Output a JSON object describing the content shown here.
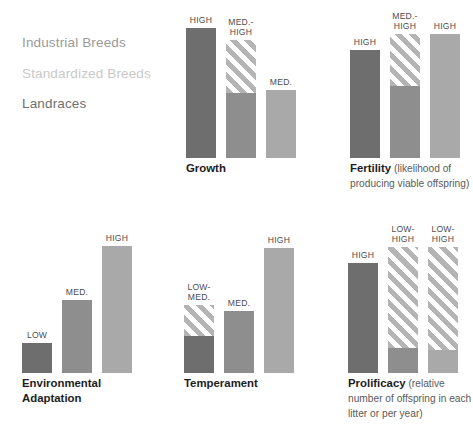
{
  "legend": {
    "items": [
      {
        "label": "Industrial Breeds",
        "color": "#9a9a9a"
      },
      {
        "label": "Standardized Breeds",
        "color": "#c9c9c9"
      },
      {
        "label": "Landraces",
        "color": "#6f6f6f"
      }
    ]
  },
  "colors": {
    "industrial": "#6e6e6e",
    "standardized": "#a9a9a9",
    "landraces": "#8e8e8e",
    "stripe": "#b4b4b4",
    "stripe_gap": "#ffffff",
    "text": "#4d4d4d",
    "caption": "#1d1d1d",
    "caption_sub": "#5a5a5a"
  },
  "chart_data": {
    "type": "bar",
    "title": "",
    "xlabel": "",
    "ylabel": "",
    "grid": false,
    "legend_position": "top-left",
    "scale": [
      "LOW",
      "LOW-MED.",
      "MED.",
      "MED.-HIGH",
      "HIGH"
    ],
    "series": [
      {
        "name": "Industrial Breeds",
        "color": "#6e6e6e"
      },
      {
        "name": "Standardized Breeds",
        "color": "#a9a9a9"
      },
      {
        "name": "Landraces",
        "color": "#8e8e8e"
      }
    ],
    "panels": [
      {
        "id": "growth",
        "title": "Growth",
        "subtitle": "",
        "bars": [
          {
            "series": "Industrial Breeds",
            "label": "HIGH",
            "value": 5,
            "height": 130,
            "striped_fraction": 0
          },
          {
            "series": "Landraces",
            "label": "MED.-\nHIGH",
            "value": 4,
            "height": 118,
            "striped_fraction": 0.45
          },
          {
            "series": "Standardized Breeds",
            "label": "MED.",
            "value": 3,
            "height": 68,
            "striped_fraction": 0
          }
        ]
      },
      {
        "id": "fertility",
        "title": "Fertility",
        "subtitle": "(likelihood of producing viable offspring)",
        "bars": [
          {
            "series": "Industrial Breeds",
            "label": "HIGH",
            "value": 5,
            "height": 108,
            "striped_fraction": 0
          },
          {
            "series": "Landraces",
            "label": "MED.-\nHIGH",
            "value": 4,
            "height": 124,
            "striped_fraction": 0.42
          },
          {
            "series": "Standardized Breeds",
            "label": "HIGH",
            "value": 5,
            "height": 124,
            "striped_fraction": 0
          }
        ]
      },
      {
        "id": "environmental-adaptation",
        "title": "Environmental Adaptation",
        "subtitle": "",
        "bars": [
          {
            "series": "Industrial Breeds",
            "label": "LOW",
            "value": 1,
            "height": 30,
            "striped_fraction": 0
          },
          {
            "series": "Landraces",
            "label": "MED.",
            "value": 3,
            "height": 73,
            "striped_fraction": 0
          },
          {
            "series": "Standardized Breeds",
            "label": "HIGH",
            "value": 5,
            "height": 127,
            "striped_fraction": 0
          }
        ]
      },
      {
        "id": "temperament",
        "title": "Temperament",
        "subtitle": "",
        "bars": [
          {
            "series": "Industrial Breeds",
            "label": "LOW-\nMED.",
            "value": 2,
            "height": 68,
            "striped_fraction": 0.46
          },
          {
            "series": "Landraces",
            "label": "MED.",
            "value": 3,
            "height": 62,
            "striped_fraction": 0
          },
          {
            "series": "Standardized Breeds",
            "label": "HIGH",
            "value": 5,
            "height": 125,
            "striped_fraction": 0
          }
        ]
      },
      {
        "id": "prolificacy",
        "title": "Prolificacy",
        "subtitle": "(relative number of offspring in each litter or per year)",
        "bars": [
          {
            "series": "Industrial Breeds",
            "label": "HIGH",
            "value": 5,
            "height": 110,
            "striped_fraction": 0
          },
          {
            "series": "Landraces",
            "label": "LOW-\nHIGH",
            "value": 3,
            "height": 126,
            "striped_fraction": 0.8
          },
          {
            "series": "Standardized Breeds",
            "label": "LOW-\nHIGH",
            "value": 3,
            "height": 126,
            "striped_fraction": 0.82
          }
        ]
      }
    ]
  }
}
